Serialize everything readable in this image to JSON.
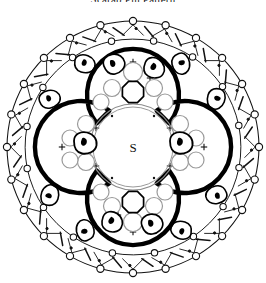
{
  "document": {
    "title": "Scarab Pin Pattern",
    "kind": "beadwork-pattern-diagram"
  },
  "figure": {
    "name": "scarab-pin-quatrefoil-diagram",
    "center_label": "S",
    "colors": {
      "ink": "#000000",
      "paper": "#ffffff",
      "thick_outline": "#000000",
      "thin_line": "#1a1a1a",
      "bead_outline": "#8a8a8a"
    },
    "strokes": {
      "quatrefoil_width": 4.2,
      "outer_ring_width": 1.0,
      "bead_width": 1.1,
      "scarab_width": 1.6
    },
    "geometry": {
      "cx": 133,
      "cy": 147,
      "outer_ring_radius": 126,
      "inner_ring_radius": 108,
      "quatrefoil_lobe_radius": 46,
      "quatrefoil_lobe_offset": 52,
      "center_circle_radius": 42
    },
    "outer_ring": {
      "name": "outer-bead-ring",
      "node_count": 24,
      "node_radius": 3.6,
      "description": "ring of small open circles joined by shallow arcs"
    },
    "inner_ring": {
      "name": "inner-bead-ring",
      "node_count": 16,
      "node_radius": 3.2
    },
    "corner_scarabs": {
      "name": "corner-scarab-beads",
      "count": 8,
      "angles_deg": [
        30,
        60,
        120,
        150,
        210,
        240,
        300,
        330
      ],
      "radius_from_center": 96,
      "bead_rx": 11,
      "bead_ry": 8
    },
    "clusters": [
      {
        "name": "cluster-top",
        "position": "top",
        "cx": 133,
        "cy": 78,
        "scarab_count": 2,
        "round_bead_count": 5
      },
      {
        "name": "cluster-bottom",
        "position": "bottom",
        "cx": 133,
        "cy": 200,
        "scarab_count": 2,
        "round_bead_count": 5
      },
      {
        "name": "cluster-left",
        "position": "left",
        "cx": 78,
        "cy": 142,
        "scarab_count": 1,
        "round_bead_count": 4
      },
      {
        "name": "cluster-right",
        "position": "right",
        "cx": 183,
        "cy": 142,
        "scarab_count": 1,
        "round_bead_count": 4
      }
    ],
    "ornaments": {
      "plus_marks": 14,
      "dots": 30,
      "tick_marks": 26
    }
  }
}
